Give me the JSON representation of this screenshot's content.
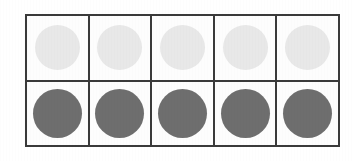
{
  "figure": {
    "kind": "grid-of-circles",
    "background_color": "#ffffff",
    "cell_background_color": "#fdfdfd",
    "border_color": "#3a3a3a",
    "border_width_px": 2,
    "columns": 5,
    "rows": 2
  },
  "chart_data": {
    "type": "table",
    "title": "",
    "xlabel": "",
    "ylabel": "",
    "grid": true,
    "legend": null,
    "columns": 5,
    "rows": 2,
    "row_labels": [
      "top-row",
      "bottom-row"
    ],
    "column_labels": [
      "1",
      "2",
      "3",
      "4",
      "5"
    ],
    "cells": [
      [
        {
          "shape": "circle",
          "fill": "#e8e8e8",
          "tone": "light",
          "diameter_px": 45
        },
        {
          "shape": "circle",
          "fill": "#e8e8e8",
          "tone": "light",
          "diameter_px": 45
        },
        {
          "shape": "circle",
          "fill": "#e8e8e8",
          "tone": "light",
          "diameter_px": 45
        },
        {
          "shape": "circle",
          "fill": "#e8e8e8",
          "tone": "light",
          "diameter_px": 45
        },
        {
          "shape": "circle",
          "fill": "#e8e8e8",
          "tone": "light",
          "diameter_px": 45
        }
      ],
      [
        {
          "shape": "circle",
          "fill": "#6e6e6e",
          "tone": "dark",
          "diameter_px": 49
        },
        {
          "shape": "circle",
          "fill": "#6e6e6e",
          "tone": "dark",
          "diameter_px": 49
        },
        {
          "shape": "circle",
          "fill": "#6e6e6e",
          "tone": "dark",
          "diameter_px": 49
        },
        {
          "shape": "circle",
          "fill": "#6e6e6e",
          "tone": "dark",
          "diameter_px": 49
        },
        {
          "shape": "circle",
          "fill": "#6e6e6e",
          "tone": "dark",
          "diameter_px": 49
        }
      ]
    ],
    "counts": {
      "light_circles": 5,
      "dark_circles": 5,
      "total_circles": 10
    }
  }
}
